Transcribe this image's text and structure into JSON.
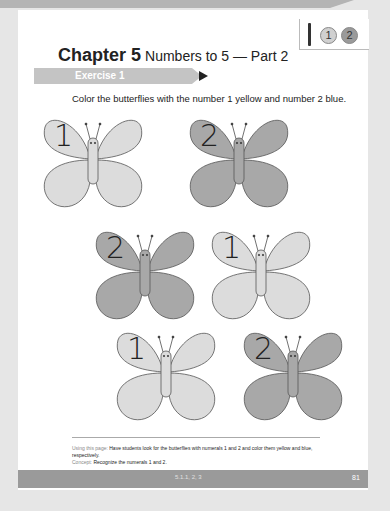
{
  "header": {
    "chapter_label": "Chapter 5",
    "chapter_subtitle": "Numbers to 5 — Part 2",
    "legend": {
      "icon": "crayon-icon",
      "coins": [
        {
          "label": "1",
          "color": "#d0d0d0",
          "meaning": "yellow"
        },
        {
          "label": "2",
          "color": "#9a9a9a",
          "meaning": "blue"
        }
      ]
    }
  },
  "exercise": {
    "title": "Exercise 1",
    "instruction": "Color the butterflies with the number 1 yellow and number 2 blue."
  },
  "butterflies": [
    {
      "number": "1",
      "fill": "#dcdcdc"
    },
    {
      "number": "2",
      "fill": "#a8a8a8"
    },
    {
      "number": "2",
      "fill": "#a8a8a8"
    },
    {
      "number": "1",
      "fill": "#dcdcdc"
    },
    {
      "number": "1",
      "fill": "#dcdcdc"
    },
    {
      "number": "2",
      "fill": "#a8a8a8"
    }
  ],
  "footer_note": {
    "using_label": "Using this page:",
    "using_text": "Have students look for the butterflies with numerals 1 and 2 and color them yellow and blue, respectively.",
    "concept_label": "Concept:",
    "concept_text": "Recognize the numerals 1 and 2."
  },
  "footer": {
    "code": "5.1.1, 2, 3",
    "page_number": "81"
  }
}
